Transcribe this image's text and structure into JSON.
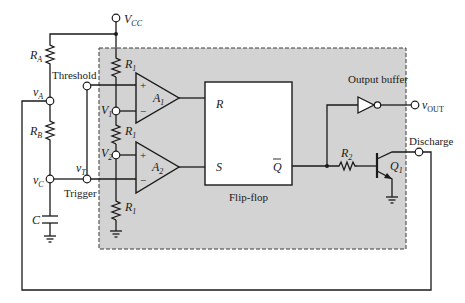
{
  "diagram": {
    "colors": {
      "ink": "#1a1a1a",
      "block_fill": "#d3d3d3",
      "flipflop_fill": "#ffffff",
      "background": "#ffffff"
    },
    "supply": {
      "label": "V",
      "sub": "CC"
    },
    "external": {
      "ra": {
        "label": "R",
        "sub": "A"
      },
      "rb": {
        "label": "R",
        "sub": "B"
      },
      "c": {
        "label": "C"
      },
      "node_a": {
        "label": "v",
        "sub": "A"
      },
      "node_c": {
        "label": "v",
        "sub": "C"
      },
      "node_t": {
        "label": "v",
        "sub": "T"
      }
    },
    "pins": {
      "threshold": "Threshold",
      "trigger": "Trigger",
      "discharge": "Discharge",
      "output": {
        "label": "v",
        "sub": "OUT"
      }
    },
    "internal": {
      "r1_top": {
        "label": "R",
        "sub": "1"
      },
      "r1_mid": {
        "label": "R",
        "sub": "1"
      },
      "r1_bot": {
        "label": "R",
        "sub": "1"
      },
      "v1": {
        "label": "V",
        "sub": "1"
      },
      "v2": {
        "label": "V",
        "sub": "2"
      },
      "a1": {
        "label": "A",
        "sub": "1",
        "plus": "+",
        "minus": "−"
      },
      "a2": {
        "label": "A",
        "sub": "2",
        "plus": "+",
        "minus": "−"
      },
      "flipflop": {
        "caption": "Flip-flop",
        "r_input": "R",
        "s_input": "S",
        "q_bar_output": "Q"
      },
      "buffer_caption": "Output buffer",
      "r2": {
        "label": "R",
        "sub": "2"
      },
      "q1": {
        "label": "Q",
        "sub": "1"
      }
    }
  }
}
